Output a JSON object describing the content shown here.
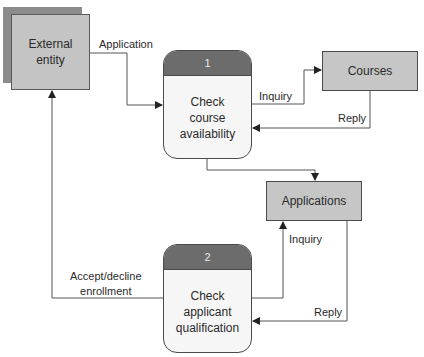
{
  "diagram": {
    "type": "data-flow-diagram",
    "colors": {
      "entity_fill": "#c4c4c4",
      "entity_shadow": "#8c8c8c",
      "store_fill": "#c6c6c6",
      "process_header": "#6c6c6c",
      "process_body": "#f6f6f6",
      "line": "#555555"
    },
    "external_entity": {
      "label": "External\nentity"
    },
    "processes": [
      {
        "number": "1",
        "label": "Check\ncourse\navailability"
      },
      {
        "number": "2",
        "label": "Check\napplicant\nqualification"
      }
    ],
    "data_stores": [
      {
        "label": "Courses"
      },
      {
        "label": "Applications"
      }
    ],
    "flows": {
      "application": "Application",
      "inquiry_courses": "Inquiry",
      "reply_courses": "Reply",
      "inquiry_applications": "Inquiry",
      "reply_applications": "Reply",
      "accept_decline": "Accept/decline\nenrollment"
    }
  }
}
